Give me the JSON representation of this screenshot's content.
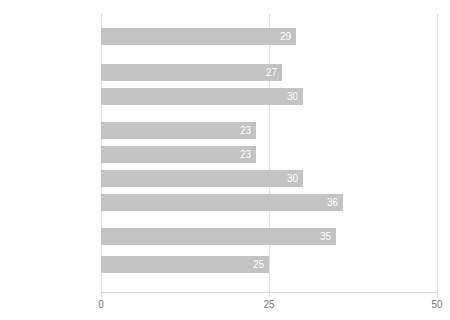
{
  "chart_data": {
    "type": "bar",
    "orientation": "horizontal",
    "title": "",
    "xlabel": "",
    "ylabel": "",
    "xlim": [
      0,
      50
    ],
    "xticks": [
      0,
      25,
      50
    ],
    "xtick_labels": [
      "0",
      "25",
      "50"
    ],
    "grid": true,
    "gridlines_x": [
      0,
      25,
      50
    ],
    "legend": null,
    "bar_color": "#c3c3c3",
    "value_label_color": "#ffffff",
    "categories": [
      "Gesamt",
      "Mädchen",
      "Jungen",
      "12-13 Jahre",
      "14-15 Jahre",
      "16-17 Jahre",
      "18-19 Jahre",
      "Haupt-/Realschule",
      "Gymnasium"
    ],
    "values": [
      29,
      27,
      30,
      23,
      23,
      30,
      36,
      35,
      25
    ],
    "groups": [
      {
        "name": "total",
        "categories": [
          "Gesamt"
        ]
      },
      {
        "name": "gender",
        "categories": [
          "Mädchen",
          "Jungen"
        ]
      },
      {
        "name": "age",
        "categories": [
          "12-13 Jahre",
          "14-15 Jahre",
          "16-17 Jahre",
          "18-19 Jahre"
        ]
      },
      {
        "name": "schooltype",
        "categories": [
          "Haupt-/Realschule",
          "Gymnasium"
        ]
      }
    ],
    "bars": [
      {
        "label": "Gesamt",
        "value": 29,
        "value_label": "29",
        "top": 28,
        "group": 0
      },
      {
        "label": "Mädchen",
        "value": 27,
        "value_label": "27",
        "top": 64,
        "group": 1
      },
      {
        "label": "Jungen",
        "value": 30,
        "value_label": "30",
        "top": 88,
        "group": 1
      },
      {
        "label": "12-13 Jahre",
        "value": 23,
        "value_label": "23",
        "top": 122,
        "group": 2
      },
      {
        "label": "14-15 Jahre",
        "value": 23,
        "value_label": "23",
        "top": 146,
        "group": 2
      },
      {
        "label": "16-17 Jahre",
        "value": 30,
        "value_label": "30",
        "top": 170,
        "group": 2
      },
      {
        "label": "18-19 Jahre",
        "value": 36,
        "value_label": "36",
        "top": 194,
        "group": 2
      },
      {
        "label": "Haupt-/Realschule",
        "value": 35,
        "value_label": "35",
        "top": 228,
        "group": 3
      },
      {
        "label": "Gymnasium",
        "value": 25,
        "value_label": "25",
        "top": 256,
        "group": 3
      }
    ]
  },
  "title_sliver": " "
}
